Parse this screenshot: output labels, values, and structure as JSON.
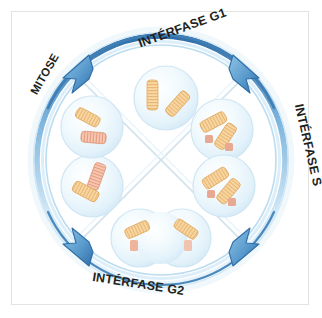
{
  "figure": {
    "background_color": "#ffffff",
    "frame_color": "#e3e3e3"
  },
  "colors": {
    "ring_dark": "#2f6ea8",
    "ring_mid": "#5b9bd0",
    "ring_light": "#bcdcf0",
    "ring_pale": "#dcecf7",
    "arrow_fill": "#4f93c7",
    "arrow_stroke": "#2f6ea8",
    "cell_fill": "#eaf5fb",
    "cell_edge": "#cfe6f3",
    "chromosome_tan": "#f5c98a",
    "chromosome_tan_light": "#fdeccd",
    "chromosome_pink": "#f0a990",
    "chromosome_pink_light": "#fbdcd0",
    "centromere": "#e9a892",
    "divider_line": "#cfe2ee"
  },
  "labels": {
    "interphase_g1": "INTÉRFASE G1",
    "interphase_s": "INTÉRFASE S",
    "interphase_g2": "INTÉRFASE G2",
    "mitose": "MITOSE"
  },
  "arrows": [
    {
      "name": "arrow-top-left",
      "direction": "clockwise",
      "angle_deg": 225
    },
    {
      "name": "arrow-top-right",
      "direction": "clockwise",
      "angle_deg": 315
    },
    {
      "name": "arrow-bottom-right",
      "direction": "clockwise",
      "angle_deg": 45
    },
    {
      "name": "arrow-bottom-left",
      "direction": "clockwise",
      "angle_deg": 135
    }
  ],
  "cells": [
    {
      "name": "cell-g1",
      "phase": "Interphase G1",
      "position": "top",
      "cx": 166,
      "cy": 98,
      "r": 32,
      "shape": "single",
      "chromosomes": [
        {
          "x": 152,
          "y": 86,
          "w": 10,
          "h": 28,
          "rot": 0,
          "color": "tan",
          "centromere": false
        },
        {
          "x": 172,
          "y": 93,
          "w": 10,
          "h": 26,
          "rot": 38,
          "color": "tan",
          "centromere": false
        }
      ]
    },
    {
      "name": "cell-s",
      "phase": "Interphase S",
      "position": "upper-right",
      "cx": 222,
      "cy": 130,
      "r": 31,
      "shape": "single",
      "chromosomes": [
        {
          "x": 208,
          "y": 115,
          "w": 11,
          "h": 27,
          "rot": 62,
          "color": "tan",
          "centromere": true
        },
        {
          "x": 221,
          "y": 128,
          "w": 11,
          "h": 27,
          "rot": 35,
          "color": "tan",
          "centromere": true
        }
      ]
    },
    {
      "name": "cell-s-late",
      "phase": "Interphase S",
      "position": "lower-right",
      "cx": 224,
      "cy": 186,
      "r": 31,
      "shape": "single",
      "chromosomes": [
        {
          "x": 209,
          "y": 172,
          "w": 11,
          "h": 28,
          "rot": 58,
          "color": "tan",
          "centromere": true
        },
        {
          "x": 224,
          "y": 182,
          "w": 11,
          "h": 27,
          "rot": 40,
          "color": "tan",
          "centromere": true
        }
      ]
    },
    {
      "name": "cell-g2",
      "phase": "Interphase G2 / division",
      "position": "bottom",
      "cx": 161,
      "cy": 238,
      "r": 38,
      "shape": "double",
      "chromosomes": [
        {
          "x": 136,
          "y": 226,
          "w": 10,
          "h": 25,
          "rot": 70,
          "color": "tan",
          "centromere": true
        },
        {
          "x": 178,
          "y": 228,
          "w": 10,
          "h": 25,
          "rot": 120,
          "color": "tan",
          "centromere": true
        }
      ]
    },
    {
      "name": "cell-mitose-telophase",
      "phase": "Mitose",
      "position": "lower-left",
      "cx": 92,
      "cy": 186,
      "r": 31,
      "shape": "single",
      "chromosomes": [
        {
          "x": 90,
          "y": 172,
          "w": 11,
          "h": 27,
          "rot": 18,
          "color": "pink",
          "centromere": false
        },
        {
          "x": 82,
          "y": 184,
          "w": 11,
          "h": 26,
          "rot": 118,
          "color": "tan",
          "centromere": false
        }
      ]
    },
    {
      "name": "cell-mitose-anaphase",
      "phase": "Mitose",
      "position": "upper-left",
      "cx": 92,
      "cy": 127,
      "r": 31,
      "shape": "single",
      "chromosomes": [
        {
          "x": 84,
          "y": 114,
          "w": 10,
          "h": 25,
          "rot": 118,
          "color": "tan",
          "centromere": false
        },
        {
          "x": 90,
          "y": 131,
          "w": 10,
          "h": 26,
          "rot": 95,
          "color": "pink",
          "centromere": false
        }
      ]
    }
  ]
}
